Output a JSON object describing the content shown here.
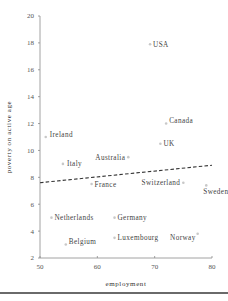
{
  "chart_data": {
    "type": "scatter",
    "title": "",
    "xlabel": "employment",
    "ylabel": "poverty on active age",
    "xlim": [
      50,
      80
    ],
    "ylim": [
      2,
      20
    ],
    "xticks": [
      50,
      60,
      70,
      80
    ],
    "yticks": [
      2,
      4,
      6,
      8,
      10,
      12,
      14,
      16,
      18,
      20
    ],
    "grid": false,
    "legend": null,
    "points": [
      {
        "label": "USA",
        "x": 69.2,
        "y": 17.9
      },
      {
        "label": "Canada",
        "x": 72,
        "y": 12
      },
      {
        "label": "Ireland",
        "x": 51,
        "y": 11
      },
      {
        "label": "UK",
        "x": 71,
        "y": 10.5
      },
      {
        "label": "Australia",
        "x": 65.4,
        "y": 9.5
      },
      {
        "label": "Italy",
        "x": 54,
        "y": 9
      },
      {
        "label": "France",
        "x": 59,
        "y": 7.5
      },
      {
        "label": "Switzerland",
        "x": 75,
        "y": 7.6
      },
      {
        "label": "Sweden",
        "x": 79,
        "y": 7.4
      },
      {
        "label": "Netherlands",
        "x": 52,
        "y": 5
      },
      {
        "label": "Germany",
        "x": 63,
        "y": 5
      },
      {
        "label": "Belgium",
        "x": 54.5,
        "y": 3
      },
      {
        "label": "Luxembourg",
        "x": 63,
        "y": 3.5
      },
      {
        "label": "Norway",
        "x": 77.5,
        "y": 3.8
      }
    ],
    "trendline": {
      "style": "dashed",
      "x": [
        50,
        80
      ],
      "y": [
        7.6,
        8.9
      ]
    }
  },
  "colors": {
    "axis": "#888888",
    "marker": "#c8c8c8",
    "trendline": "#333333",
    "text": "#444444"
  }
}
